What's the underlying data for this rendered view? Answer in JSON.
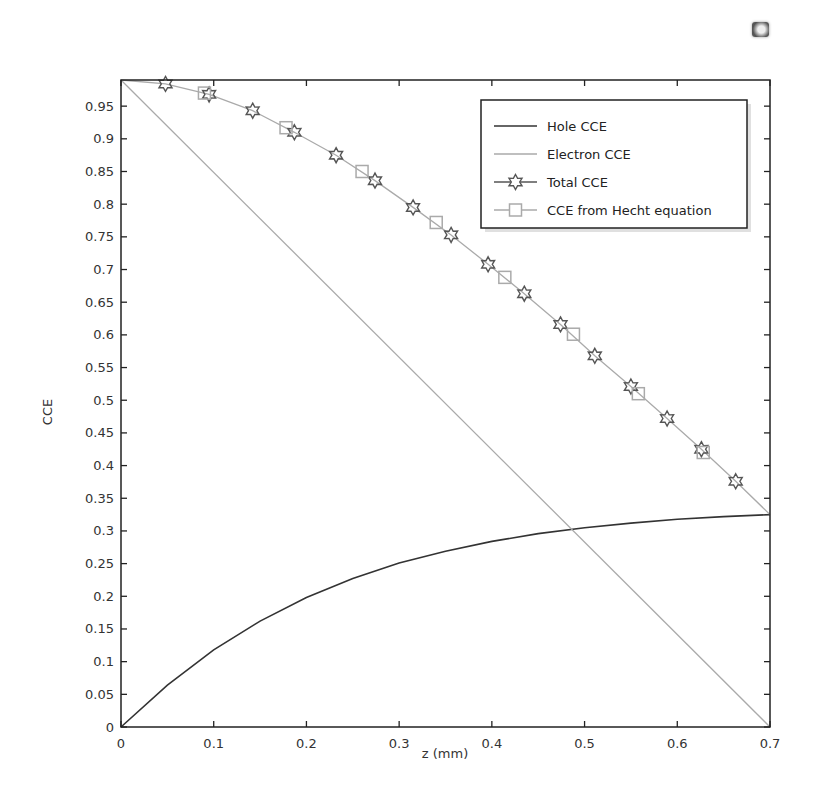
{
  "corner_icon": "image-frame-icon",
  "chart_data": {
    "type": "line",
    "title": "",
    "xlabel": "z (mm)",
    "ylabel": "CCE",
    "xlim": [
      0,
      0.7
    ],
    "ylim": [
      0,
      0.99
    ],
    "grid": false,
    "legend_position": "upper right",
    "xticks": [
      0,
      0.1,
      0.2,
      0.3,
      0.4,
      0.5,
      0.6,
      0.7
    ],
    "xtick_labels": [
      "0",
      "0.1",
      "0.2",
      "0.3",
      "0.4",
      "0.5",
      "0.6",
      "0.7"
    ],
    "yticks": [
      0,
      0.05,
      0.1,
      0.15,
      0.2,
      0.25,
      0.3,
      0.35,
      0.4,
      0.45,
      0.5,
      0.55,
      0.6,
      0.65,
      0.7,
      0.75,
      0.8,
      0.85,
      0.9,
      0.95
    ],
    "ytick_labels": [
      "0",
      "0.05",
      "0.1",
      "0.15",
      "0.2",
      "0.25",
      "0.3",
      "0.35",
      "0.4",
      "0.45",
      "0.5",
      "0.55",
      "0.6",
      "0.65",
      "0.7",
      "0.75",
      "0.8",
      "0.85",
      "0.9",
      "0.95"
    ],
    "series": [
      {
        "name": "Hole CCE",
        "color": "#333333",
        "marker": "none",
        "x": [
          0,
          0.05,
          0.1,
          0.15,
          0.2,
          0.25,
          0.3,
          0.35,
          0.4,
          0.45,
          0.5,
          0.55,
          0.6,
          0.65,
          0.7
        ],
        "y": [
          0,
          0.064,
          0.118,
          0.162,
          0.198,
          0.227,
          0.251,
          0.269,
          0.284,
          0.296,
          0.305,
          0.312,
          0.318,
          0.322,
          0.325
        ]
      },
      {
        "name": "Electron CCE",
        "color": "#aaaaaa",
        "marker": "none",
        "x": [
          0,
          0.7
        ],
        "y": [
          0.99,
          0
        ]
      },
      {
        "name": "Total CCE",
        "color": "#555555",
        "line_color": "#aaaaaa",
        "marker": "star",
        "x": [
          0,
          0.048,
          0.095,
          0.142,
          0.187,
          0.232,
          0.274,
          0.315,
          0.356,
          0.396,
          0.435,
          0.474,
          0.511,
          0.55,
          0.589,
          0.626,
          0.663,
          0.7
        ],
        "y": [
          0.99,
          0.984,
          0.968,
          0.943,
          0.91,
          0.875,
          0.836,
          0.795,
          0.753,
          0.708,
          0.663,
          0.616,
          0.568,
          0.521,
          0.472,
          0.425,
          0.376,
          0.325
        ]
      },
      {
        "name": "CCE from Hecht equation",
        "color": "#aaaaaa",
        "marker": "square",
        "x": [
          0.09,
          0.178,
          0.26,
          0.34,
          0.414,
          0.488,
          0.558,
          0.628
        ],
        "y": [
          0.97,
          0.917,
          0.85,
          0.772,
          0.688,
          0.601,
          0.51,
          0.42
        ]
      }
    ]
  }
}
